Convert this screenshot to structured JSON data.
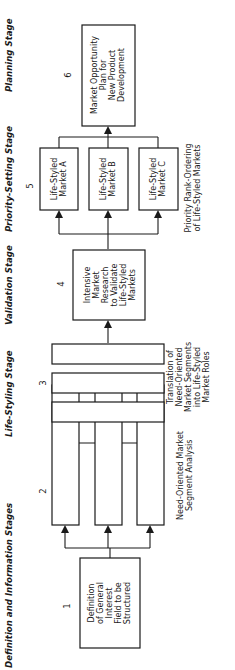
{
  "stages": [
    {
      "id": "definition",
      "label": "Definition and Information Stages"
    },
    {
      "id": "life-styling",
      "label": "Life-Styling Stage"
    },
    {
      "id": "validation",
      "label": "Validation Stage"
    },
    {
      "id": "priority-setting",
      "label": "Priority-Setting Stage"
    },
    {
      "id": "planning",
      "label": "Planning Stage"
    }
  ],
  "steps": {
    "s1": {
      "number": "1",
      "lines": [
        "Definition",
        "of General",
        "Interest",
        "Field to be",
        "Structured"
      ]
    },
    "s2": {
      "number": "2",
      "caption": [
        "Need-Oriented Market",
        "Segment Analysis"
      ]
    },
    "s3": {
      "number": "3",
      "caption": [
        "Translation of",
        "Need-Oriented",
        "Market Segments",
        "into Life-Styled",
        "Market Roles"
      ]
    },
    "s4": {
      "number": "4",
      "lines": [
        "Intensive",
        "Market",
        "Research",
        "to Validate",
        "Life-Styled",
        "Markets"
      ]
    },
    "s5": {
      "number": "5",
      "markets": [
        {
          "lines": [
            "Life-Styled",
            "Market A"
          ]
        },
        {
          "lines": [
            "Life-Styled",
            "Market B"
          ]
        },
        {
          "lines": [
            "Life-Styled",
            "Market C"
          ]
        }
      ],
      "caption": [
        "Priority Rank-Ordering",
        "of Life-Styled Markets"
      ]
    },
    "s6": {
      "number": "6",
      "lines": [
        "Market Opportunity",
        "Plan for",
        "New Product",
        "Development"
      ]
    }
  }
}
